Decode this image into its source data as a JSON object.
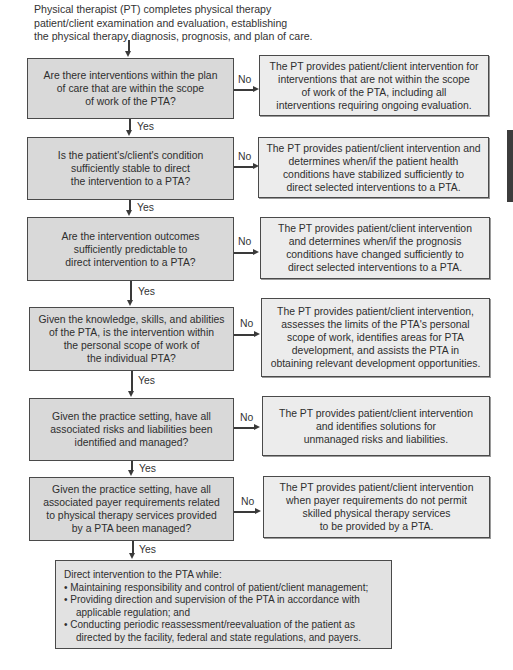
{
  "intro": "Physical therapist (PT) completes physical therapy\npatient/client examination and evaluation, establishing\nthe physical therapy diagnosis, prognosis, and plan of care.",
  "labels": {
    "yes": "Yes",
    "no": "No"
  },
  "steps": [
    {
      "question": "Are there interventions within the plan\nof care that are within the scope\nof work of the PTA?",
      "no_outcome": "The PT provides patient/client intervention for\ninterventions that are not within the scope\nof work of the PTA, including all\ninterventions requiring ongoing evaluation."
    },
    {
      "question": "Is the patient's/client's condition\nsufficiently stable to direct\nthe intervention to a PTA?",
      "no_outcome": "The PT provides patient/client intervention and\ndetermines when/if the patient health\nconditions have stabilized sufficiently to\ndirect selected interventions to a PTA."
    },
    {
      "question": "Are the intervention outcomes\nsufficiently predictable to\ndirect intervention to a PTA?",
      "no_outcome": "The PT provides patient/client intervention\nand determines when/if the prognosis\nconditions have changed sufficiently to\ndirect selected interventions to a PTA."
    },
    {
      "question": "Given the knowledge, skills, and abilities\nof the PTA, is the intervention within\nthe personal scope of work of\nthe individual PTA?",
      "no_outcome": "The PT provides patient/client intervention,\nassesses the limits of the PTA's personal\nscope of work, identifies areas for PTA\ndevelopment, and assists the PTA in\nobtaining relevant development opportunities."
    },
    {
      "question": "Given the practice setting, have all\nassociated risks and liabilities been\nidentified and managed?",
      "no_outcome": "The PT provides patient/client intervention\nand identifies solutions for\nunmanaged risks and liabilities."
    },
    {
      "question": "Given the practice setting, have all\nassociated payer requirements related\nto physical therapy services provided\nby a PTA been managed?",
      "no_outcome": "The PT provides patient/client intervention\nwhen payer requirements do not permit\nskilled physical therapy services\nto be provided by a PTA."
    }
  ],
  "final": {
    "heading": "Direct intervention to the PTA while:",
    "bullets": [
      "• Maintaining responsibility and control of patient/client management;",
      "• Providing direction and supervision of the PTA in accordance with applicable regulation; and",
      "• Conducting periodic reassessment/reevaluation of the patient as directed by the facility, federal and state regulations, and payers."
    ]
  }
}
